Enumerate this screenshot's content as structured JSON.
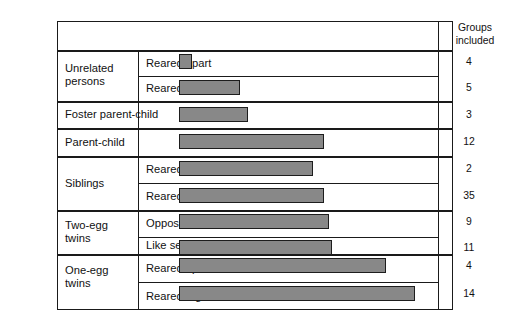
{
  "header": {
    "category_label": "Category",
    "groups_label_line1": "Groups",
    "groups_label_line2": "included"
  },
  "axis": {
    "ticks": [
      "0.00",
      "0.10",
      "0.20",
      "0.30",
      "0.40",
      "0.50",
      "0.60",
      "0.70",
      "0.80",
      "0.90"
    ]
  },
  "chart_data": {
    "type": "bar",
    "orientation": "horizontal",
    "title": "",
    "xlabel": "",
    "ylabel": "Category",
    "xlim": [
      0.0,
      0.95
    ],
    "grid": false,
    "legend": null,
    "bar_color": "#888888",
    "bar_edge_color": "#1d1d1d",
    "categories": [
      "Unrelated persons — Reared apart",
      "Unrelated persons — Reared together",
      "Foster parent-child",
      "Parent-child",
      "Siblings — Reared apart",
      "Siblings — Reared together",
      "Two-egg twins — Opposite sex",
      "Two-egg twins — Like sex",
      "One-egg twins — Reared apart",
      "One-egg twins — Reared together"
    ],
    "values": [
      0.05,
      0.23,
      0.26,
      0.54,
      0.5,
      0.54,
      0.56,
      0.57,
      0.77,
      0.88
    ],
    "groups_included": [
      4,
      5,
      3,
      12,
      2,
      35,
      9,
      11,
      4,
      14
    ]
  },
  "rows": [
    {
      "group": "Unrelated\npersons",
      "group_line1": "Unrelated",
      "group_line2": "persons",
      "sub": "Reared apart",
      "value": 0.05,
      "groups": "4"
    },
    {
      "group": "",
      "sub": "Reared together",
      "value": 0.23,
      "groups": "5"
    },
    {
      "group": "Foster parent-child",
      "group_line1": "Foster parent-child",
      "sub": "",
      "value": 0.26,
      "groups": "3"
    },
    {
      "group": "Parent-child",
      "group_line1": "Parent-child",
      "sub": "",
      "value": 0.54,
      "groups": "12"
    },
    {
      "group": "Siblings",
      "group_line1": "Siblings",
      "sub": "Reared apart",
      "value": 0.5,
      "groups": "2"
    },
    {
      "group": "",
      "sub": "Reared together",
      "value": 0.54,
      "groups": "35"
    },
    {
      "group": "Two-egg\ntwins",
      "group_line1": "Two-egg",
      "group_line2": "twins",
      "sub": "Opposite sex",
      "value": 0.56,
      "groups": "9"
    },
    {
      "group": "",
      "sub": "Like sex",
      "value": 0.57,
      "groups": "11"
    },
    {
      "group": "One-egg\ntwins",
      "group_line1": "One-egg",
      "group_line2": "twins",
      "sub": "Reared apart",
      "value": 0.77,
      "groups": "4"
    },
    {
      "group": "",
      "sub": "Reared together",
      "value": 0.88,
      "groups": "14"
    }
  ]
}
